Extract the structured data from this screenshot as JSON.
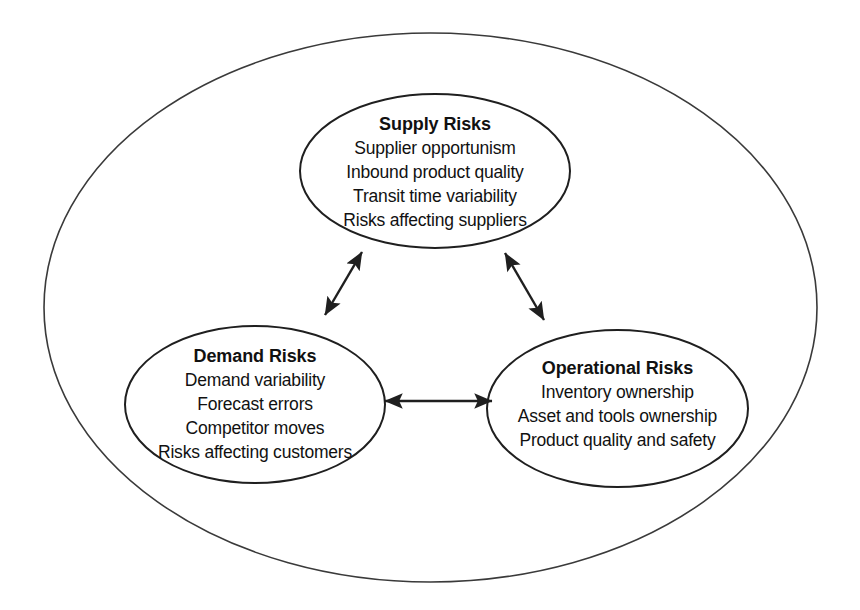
{
  "diagram": {
    "type": "venn-style grouping diagram",
    "background_color": "#ffffff",
    "stroke_color": "#1f1f1f",
    "text_color": "#111111",
    "outer_boundary": {
      "shape": "ellipse",
      "label": ""
    },
    "nodes": [
      {
        "id": "supply",
        "title": "Supply Risks",
        "items": [
          "Supplier opportunism",
          "Inbound product quality",
          "Transit time variability",
          "Risks affecting suppliers"
        ]
      },
      {
        "id": "demand",
        "title": "Demand Risks",
        "items": [
          "Demand variability",
          "Forecast errors",
          "Competitor moves",
          "Risks affecting customers"
        ]
      },
      {
        "id": "operational",
        "title": "Operational Risks",
        "items": [
          "Inventory ownership",
          "Asset and tools ownership",
          "Product quality and safety"
        ]
      }
    ],
    "connectors": [
      {
        "id": "demand-supply",
        "from": "demand",
        "to": "supply",
        "style": "double-headed-arrow"
      },
      {
        "id": "supply-operational",
        "from": "supply",
        "to": "operational",
        "style": "double-headed-arrow"
      },
      {
        "id": "demand-operational",
        "from": "demand",
        "to": "operational",
        "style": "double-headed-arrow"
      }
    ]
  }
}
